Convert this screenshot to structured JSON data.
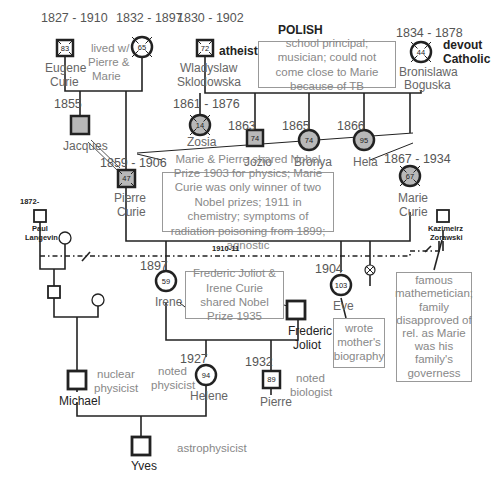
{
  "title_label": "POLISH",
  "people": {
    "eugene": {
      "years": "1827 - 1910",
      "name_line1": "Eugene",
      "name_line2": "Curie",
      "age": "83"
    },
    "sophie": {
      "years": "1832 - 1897",
      "age": "65",
      "note": [
        "lived w/",
        "Pierre &",
        "Marie"
      ]
    },
    "wladyslaw": {
      "years": "1830 - 1902",
      "name_line1": "Wladyslaw",
      "name_line2": "Sklodowska",
      "age": "72",
      "note": "atheist"
    },
    "bronislawa": {
      "years": "1834 - 1878",
      "name_line1": "Bronislawa",
      "name_line2": "Boguska",
      "age": "44",
      "note_line1": "devout",
      "note_line2": "Catholic"
    },
    "jacques": {
      "years": "1855",
      "name": "Jacques"
    },
    "zosia": {
      "years": "1861 - 1876",
      "name": "Zosia",
      "age": "14"
    },
    "jozio": {
      "years": "1863",
      "name": "Jozio",
      "age": "74"
    },
    "bronya": {
      "years": "1865",
      "name": "Bronya",
      "age": "74"
    },
    "hela": {
      "years": "1866",
      "name": "Hela",
      "age": "95"
    },
    "pierre": {
      "years": "1859 - 1906",
      "name_line1": "Pierre",
      "name_line2": "Curie",
      "age": "47"
    },
    "marie": {
      "years": "1867 - 1934",
      "name_line1": "Marie",
      "name_line2": "Curie",
      "age": "67"
    },
    "paul": {
      "years": "1872-",
      "name_line1": "Paul",
      "name_line2": "Langevin"
    },
    "kazimeirz": {
      "name_line1": "Kazimeirz",
      "name_line2": "Zorawski"
    },
    "irene": {
      "years": "1897",
      "name": "Irene",
      "age": "59"
    },
    "eve": {
      "years": "1904",
      "name": "Eve",
      "age": "103"
    },
    "frederic": {
      "name_line1": "Frederic",
      "name_line2": "Joliot"
    },
    "helene": {
      "years": "1927",
      "name": "Helene",
      "age": "94",
      "note": [
        "noted",
        "physicist"
      ]
    },
    "pierre_joliot": {
      "years": "1932",
      "name": "Pierre",
      "age": "89",
      "note": [
        "noted",
        "biologist"
      ]
    },
    "michael": {
      "name": "Michael",
      "note": [
        "nuclear",
        "physicist"
      ]
    },
    "yves": {
      "name": "Yves",
      "note": "astrophysicist"
    }
  },
  "relationships": {
    "affair_years": "1910-11"
  },
  "notes": {
    "polish_parents": "school principal; musician; could not come close to Marie because of TB",
    "curies": "Marie & Pierre shared Nobel Prize 1903 for physics; Marie Curie was only winner of two Nobel prizes; 1911 in chemistry; symptoms of radiation poisoning from 1899; agnostic",
    "joliots": "Frederic Joliot & Irene Curie shared Nobel Prize 1935",
    "eve": "wrote mother's biography",
    "kazimeirz": "famous mathemetician; family disapproved of rel. as Marie was his family's governess"
  },
  "colors": {
    "line": "#222222",
    "fill_gray": "#b8b8b8",
    "note_text": "#888888",
    "box_border": "#999999"
  }
}
